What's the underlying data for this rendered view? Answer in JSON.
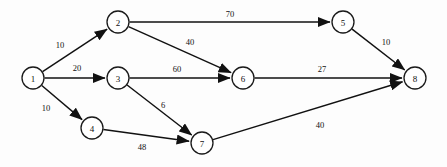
{
  "diagram": {
    "type": "directed-weighted-graph",
    "canvas": {
      "width": 447,
      "height": 167
    },
    "style": {
      "background_color": "#fdfdfd",
      "node_fill": "#ffffff",
      "node_stroke": "#1a1a1a",
      "edge_color": "#111111",
      "label_color": "#111111",
      "node_radius": 11
    },
    "nodes": [
      {
        "id": "1",
        "label": "1",
        "x": 33,
        "y": 78
      },
      {
        "id": "2",
        "label": "2",
        "x": 118,
        "y": 22
      },
      {
        "id": "3",
        "label": "3",
        "x": 118,
        "y": 78
      },
      {
        "id": "4",
        "label": "4",
        "x": 92,
        "y": 128
      },
      {
        "id": "5",
        "label": "5",
        "x": 343,
        "y": 22
      },
      {
        "id": "6",
        "label": "6",
        "x": 243,
        "y": 78
      },
      {
        "id": "7",
        "label": "7",
        "x": 202,
        "y": 143
      },
      {
        "id": "8",
        "label": "8",
        "x": 415,
        "y": 78
      }
    ],
    "edges": [
      {
        "from": "1",
        "to": "2",
        "weight": "10",
        "label_x": 60,
        "label_y": 45
      },
      {
        "from": "1",
        "to": "3",
        "weight": "20",
        "label_x": 77,
        "label_y": 68
      },
      {
        "from": "1",
        "to": "4",
        "weight": "10",
        "label_x": 46,
        "label_y": 108
      },
      {
        "from": "2",
        "to": "5",
        "weight": "70",
        "label_x": 230,
        "label_y": 14
      },
      {
        "from": "2",
        "to": "6",
        "weight": "40",
        "label_x": 190,
        "label_y": 42
      },
      {
        "from": "3",
        "to": "6",
        "weight": "60",
        "label_x": 177,
        "label_y": 69
      },
      {
        "from": "3",
        "to": "7",
        "weight": "6",
        "label_x": 163,
        "label_y": 105
      },
      {
        "from": "4",
        "to": "7",
        "weight": "48",
        "label_x": 142,
        "label_y": 147
      },
      {
        "from": "5",
        "to": "8",
        "weight": "10",
        "label_x": 386,
        "label_y": 42
      },
      {
        "from": "6",
        "to": "8",
        "weight": "27",
        "label_x": 322,
        "label_y": 69
      },
      {
        "from": "7",
        "to": "8",
        "weight": "40",
        "label_x": 320,
        "label_y": 125
      }
    ]
  }
}
